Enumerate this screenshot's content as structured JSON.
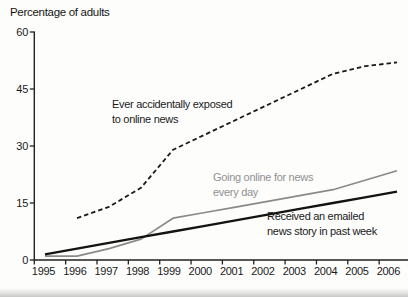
{
  "title": "Percentage of adults",
  "colors": {
    "axis": "#222222",
    "text": "#1a1a1a",
    "dashed_line": "#1a1a1a",
    "gray_line": "#8a8a8a",
    "gray_label": "#909090",
    "black_line": "#131313"
  },
  "chart_data": {
    "type": "line",
    "title": "Percentage of adults",
    "xlabel": "",
    "ylabel": "Percentage of adults",
    "x_tick_labels": [
      "1995",
      "1996",
      "1997",
      "1998",
      "1999",
      "2000",
      "2001",
      "2002",
      "2003",
      "2004",
      "2005",
      "2006"
    ],
    "y_ticks": [
      0,
      15,
      30,
      45,
      60
    ],
    "ylim": [
      0,
      60
    ],
    "xlim": [
      1995,
      2006
    ],
    "grid": false,
    "legend_position": "inline-annotations",
    "series": [
      {
        "id": "accidental-exposure",
        "name": "Ever accidentally exposed to online news",
        "style": "dashed",
        "color": "#1a1a1a",
        "x": [
          1996,
          1997,
          1998,
          1999,
          2000,
          2001,
          2002,
          2003,
          2004,
          2005,
          2006
        ],
        "values": [
          11,
          14,
          19,
          29,
          33,
          37,
          41,
          45,
          49,
          51,
          52
        ]
      },
      {
        "id": "daily-online-news",
        "name": "Going online for news every day",
        "style": "solid",
        "color": "#8a8a8a",
        "x": [
          1995,
          1996,
          1997,
          1998,
          1999,
          2000,
          2001,
          2002,
          2003,
          2004,
          2005,
          2006
        ],
        "values": [
          1,
          1,
          3,
          5.5,
          11,
          12.5,
          14,
          15.5,
          17,
          18.5,
          21,
          23.5
        ]
      },
      {
        "id": "emailed-news-story",
        "name": "Received an emailed news story in past week",
        "style": "solid",
        "color": "#131313",
        "x": [
          1995,
          1996,
          1997,
          1998,
          1999,
          2000,
          2001,
          2002,
          2003,
          2004,
          2005,
          2006
        ],
        "values": [
          1.5,
          3,
          4.5,
          6,
          7.5,
          9,
          10.5,
          12,
          13.5,
          15,
          16.5,
          18
        ]
      }
    ],
    "annotations": [
      {
        "id": "exposed",
        "lines": [
          "Ever accidentally exposed",
          "to online news"
        ],
        "color": "#1a1a1a"
      },
      {
        "id": "daily",
        "lines": [
          "Going online for news",
          "every day"
        ],
        "color": "#909090"
      },
      {
        "id": "email",
        "lines": [
          "Received an emailed",
          "news story in past week"
        ],
        "color": "#1a1a1a"
      }
    ]
  }
}
